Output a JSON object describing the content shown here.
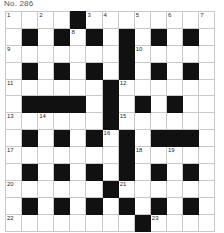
{
  "header": {
    "title": "No. 286"
  },
  "grid": {
    "columns": 13,
    "rows": 12,
    "cell_size_px": 17,
    "block_color": "#111111",
    "cell_color": "#ffffff",
    "border_color": "#c9c9c9",
    "number_color": "#2a2a2a",
    "cells": [
      [
        {
          "type": "open",
          "num": "1"
        },
        {
          "type": "open"
        },
        {
          "type": "open",
          "num": "2"
        },
        {
          "type": "open"
        },
        {
          "type": "block"
        },
        {
          "type": "open",
          "num": "3"
        },
        {
          "type": "open",
          "num": "4"
        },
        {
          "type": "open"
        },
        {
          "type": "open",
          "num": "5"
        },
        {
          "type": "open"
        },
        {
          "type": "open",
          "num": "6"
        },
        {
          "type": "open"
        },
        {
          "type": "open",
          "num": "7"
        }
      ],
      [
        {
          "type": "open"
        },
        {
          "type": "block"
        },
        {
          "type": "open"
        },
        {
          "type": "block"
        },
        {
          "type": "open",
          "num": "8"
        },
        {
          "type": "block"
        },
        {
          "type": "open"
        },
        {
          "type": "block"
        },
        {
          "type": "open"
        },
        {
          "type": "block"
        },
        {
          "type": "open"
        },
        {
          "type": "block"
        },
        {
          "type": "open"
        }
      ],
      [
        {
          "type": "open",
          "num": "9"
        },
        {
          "type": "open"
        },
        {
          "type": "open"
        },
        {
          "type": "open"
        },
        {
          "type": "open"
        },
        {
          "type": "open"
        },
        {
          "type": "open"
        },
        {
          "type": "block"
        },
        {
          "type": "open",
          "num": "10"
        },
        {
          "type": "open"
        },
        {
          "type": "open"
        },
        {
          "type": "open"
        },
        {
          "type": "open"
        }
      ],
      [
        {
          "type": "open"
        },
        {
          "type": "block"
        },
        {
          "type": "open"
        },
        {
          "type": "block"
        },
        {
          "type": "open"
        },
        {
          "type": "block"
        },
        {
          "type": "open"
        },
        {
          "type": "block"
        },
        {
          "type": "open"
        },
        {
          "type": "block"
        },
        {
          "type": "open"
        },
        {
          "type": "block"
        },
        {
          "type": "open"
        }
      ],
      [
        {
          "type": "open",
          "num": "11"
        },
        {
          "type": "open"
        },
        {
          "type": "open"
        },
        {
          "type": "open"
        },
        {
          "type": "open"
        },
        {
          "type": "open"
        },
        {
          "type": "block"
        },
        {
          "type": "open",
          "num": "12"
        },
        {
          "type": "open"
        },
        {
          "type": "open"
        },
        {
          "type": "open"
        },
        {
          "type": "open"
        },
        {
          "type": "open"
        }
      ],
      [
        {
          "type": "open"
        },
        {
          "type": "block"
        },
        {
          "type": "block"
        },
        {
          "type": "block"
        },
        {
          "type": "block"
        },
        {
          "type": "open"
        },
        {
          "type": "block"
        },
        {
          "type": "open"
        },
        {
          "type": "block"
        },
        {
          "type": "open"
        },
        {
          "type": "block"
        },
        {
          "type": "open"
        },
        {
          "type": "open"
        }
      ],
      [
        {
          "type": "open",
          "num": "13"
        },
        {
          "type": "open"
        },
        {
          "type": "open",
          "num": "14"
        },
        {
          "type": "open"
        },
        {
          "type": "open"
        },
        {
          "type": "open"
        },
        {
          "type": "block"
        },
        {
          "type": "open",
          "num": "15"
        },
        {
          "type": "open"
        },
        {
          "type": "open"
        },
        {
          "type": "open"
        },
        {
          "type": "open"
        },
        {
          "type": "open"
        }
      ],
      [
        {
          "type": "open"
        },
        {
          "type": "block"
        },
        {
          "type": "open"
        },
        {
          "type": "block"
        },
        {
          "type": "open"
        },
        {
          "type": "block"
        },
        {
          "type": "open",
          "num": "16"
        },
        {
          "type": "block"
        },
        {
          "type": "open"
        },
        {
          "type": "block"
        },
        {
          "type": "block"
        },
        {
          "type": "block"
        },
        {
          "type": "open"
        }
      ],
      [
        {
          "type": "open",
          "num": "17"
        },
        {
          "type": "open"
        },
        {
          "type": "open"
        },
        {
          "type": "open"
        },
        {
          "type": "open"
        },
        {
          "type": "open"
        },
        {
          "type": "open"
        },
        {
          "type": "block"
        },
        {
          "type": "open",
          "num": "18"
        },
        {
          "type": "open"
        },
        {
          "type": "open",
          "num": "19"
        },
        {
          "type": "open"
        },
        {
          "type": "open"
        }
      ],
      [
        {
          "type": "open"
        },
        {
          "type": "block"
        },
        {
          "type": "open"
        },
        {
          "type": "block"
        },
        {
          "type": "open"
        },
        {
          "type": "block"
        },
        {
          "type": "open"
        },
        {
          "type": "block"
        },
        {
          "type": "open"
        },
        {
          "type": "block"
        },
        {
          "type": "open"
        },
        {
          "type": "block"
        },
        {
          "type": "open"
        }
      ],
      [
        {
          "type": "open",
          "num": "20"
        },
        {
          "type": "open"
        },
        {
          "type": "open"
        },
        {
          "type": "open"
        },
        {
          "type": "open"
        },
        {
          "type": "open"
        },
        {
          "type": "block"
        },
        {
          "type": "open",
          "num": "21"
        },
        {
          "type": "open"
        },
        {
          "type": "open"
        },
        {
          "type": "open"
        },
        {
          "type": "open"
        },
        {
          "type": "open"
        }
      ],
      [
        {
          "type": "open"
        },
        {
          "type": "block"
        },
        {
          "type": "open"
        },
        {
          "type": "block"
        },
        {
          "type": "open"
        },
        {
          "type": "block"
        },
        {
          "type": "open"
        },
        {
          "type": "block"
        },
        {
          "type": "open"
        },
        {
          "type": "block"
        },
        {
          "type": "open"
        },
        {
          "type": "block"
        },
        {
          "type": "open"
        }
      ],
      [
        {
          "type": "open",
          "num": "22"
        },
        {
          "type": "open"
        },
        {
          "type": "open"
        },
        {
          "type": "open"
        },
        {
          "type": "open"
        },
        {
          "type": "open"
        },
        {
          "type": "open"
        },
        {
          "type": "open"
        },
        {
          "type": "block"
        },
        {
          "type": "open",
          "num": "23"
        },
        {
          "type": "open"
        },
        {
          "type": "open"
        },
        {
          "type": "open"
        }
      ]
    ]
  }
}
